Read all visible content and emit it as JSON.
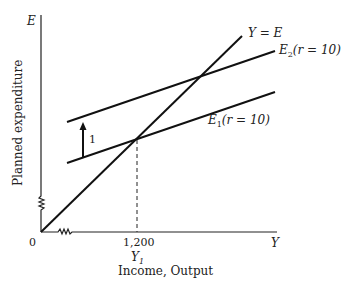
{
  "diagram": {
    "y_axis_symbol": "E",
    "y_axis_label": "Planned expenditure",
    "x_axis_symbol": "Y",
    "x_axis_label": "Income, Output",
    "origin_label": "0",
    "x_tick_value": "1,200",
    "x_tick_symbol": "Y",
    "x_tick_subscript": "1",
    "shift_label": "1",
    "lines": [
      {
        "id": "Y=E",
        "label": "Y = E"
      },
      {
        "id": "E2",
        "label_main": "E",
        "label_sub": "2",
        "label_rest": "(r = 10)"
      },
      {
        "id": "E1",
        "label_main": "E",
        "label_sub": "1",
        "label_rest": "(r = 10)"
      }
    ],
    "colors": {
      "ink": "#111111",
      "background": "#ffffff"
    }
  }
}
